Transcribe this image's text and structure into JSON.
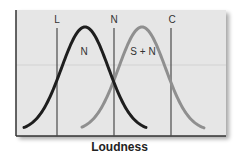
{
  "chart_data": {
    "type": "line",
    "title": "",
    "xlabel": "Loudness",
    "ylabel": "",
    "grid": false,
    "series": [
      {
        "name": "N",
        "color": "#1e1e1e",
        "description": "noise distribution",
        "peak_x": 85,
        "x_range": [
          24,
          146
        ]
      },
      {
        "name": "S + N",
        "color": "#8f8f8f",
        "description": "signal plus noise distribution",
        "peak_x": 142,
        "x_range": [
          82,
          204
        ]
      }
    ],
    "criterion_lines": [
      {
        "label": "L",
        "x": 57
      },
      {
        "label": "N",
        "x": 114
      },
      {
        "label": "C",
        "x": 171
      }
    ]
  },
  "labels": {
    "criterion_L": "L",
    "criterion_N": "N",
    "criterion_C": "C",
    "curve_noise": "N",
    "curve_signal": "S + N",
    "x_axis": "Loudness"
  },
  "colors": {
    "plot_background": "#e6e6e6",
    "noise_curve": "#1e1e1e",
    "signal_curve": "#8f8f8f",
    "criterion_line": "#4a4a4a",
    "axis": "#333333"
  }
}
